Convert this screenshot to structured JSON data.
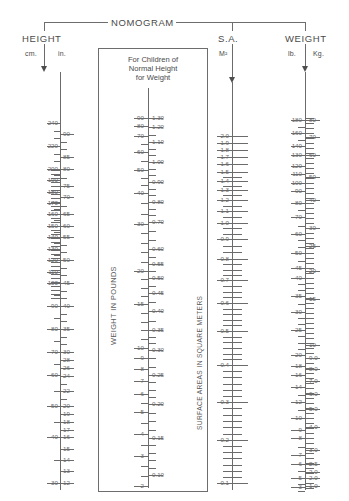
{
  "header": {
    "main_title": "NOMOGRAM",
    "height_title": "HEIGHT",
    "height_unit_left": "cm.",
    "height_unit_right": "in.",
    "sa_title": "S.A.",
    "sa_unit": "M²",
    "weight_title": "WEIGHT",
    "weight_unit_left": "lb.",
    "weight_unit_right": "Kg."
  },
  "panel": {
    "title_line1": "For Children of",
    "title_line2": "Normal Height",
    "title_line3": "for Weight",
    "caption_left": "WEIGHT IN POUNDS",
    "caption_right": "SURFACE AREAS IN SQUARE METERS"
  },
  "chart_data": {
    "type": "nomogram",
    "title": "NOMOGRAM",
    "scales": [
      {
        "name": "height-cm",
        "label": "cm.",
        "side": "left",
        "axis": "height",
        "unit": "cm",
        "ticks": [
          240,
          220,
          200,
          190,
          180,
          170,
          160,
          150,
          140,
          130,
          120,
          110,
          100,
          90,
          80,
          70,
          60,
          50,
          40,
          30
        ],
        "range": [
          30,
          245
        ]
      },
      {
        "name": "height-in",
        "label": "in.",
        "side": "right",
        "axis": "height",
        "unit": "in",
        "ticks": [
          90,
          85,
          80,
          75,
          70,
          65,
          60,
          55,
          50,
          45,
          40,
          35,
          30,
          28,
          26,
          24,
          22,
          20,
          19,
          18,
          17,
          16,
          15,
          14,
          13,
          12
        ],
        "range": [
          12,
          95
        ]
      },
      {
        "name": "panel-weight-pounds",
        "label": "WEIGHT IN POUNDS",
        "side": "left",
        "axis": "panel",
        "unit": "lb",
        "ticks": [
          90,
          80,
          70,
          60,
          50,
          40,
          30,
          20,
          15,
          10,
          9,
          8,
          7,
          6,
          5,
          4,
          3,
          2
        ],
        "range": [
          2,
          95
        ]
      },
      {
        "name": "panel-surface-area",
        "label": "SURFACE AREAS IN SQUARE METERS",
        "side": "right",
        "axis": "panel",
        "unit": "M2",
        "ticks": [
          "1.30",
          "1.20",
          "1.10",
          "1.00",
          "0.90",
          "0.80",
          "0.70",
          "0.60",
          "0.55",
          "0.50",
          "0.45",
          "0.40",
          "0.35",
          "0.30",
          "0.25",
          "0.20",
          "0.15",
          "0.10"
        ],
        "range": [
          0.1,
          1.35
        ]
      },
      {
        "name": "surface-area",
        "label": "S.A.",
        "side": "left",
        "axis": "sa",
        "unit": "M2",
        "ticks": [
          "2.0",
          "1.9",
          "1.8",
          "1.7",
          "1.6",
          "1.5",
          "1.4",
          "1.3",
          "1.2",
          "1.1",
          "1.0",
          "0.9",
          "0.8",
          "0.7",
          "0.6",
          "0.5",
          "0.4",
          "0.3",
          "0.2",
          "0.1"
        ],
        "range": [
          0.1,
          2.05
        ]
      },
      {
        "name": "weight-lb",
        "label": "lb.",
        "side": "left",
        "axis": "weight",
        "unit": "lb",
        "ticks": [
          180,
          160,
          140,
          130,
          120,
          110,
          100,
          90,
          80,
          70,
          60,
          50,
          45,
          40,
          35,
          30,
          25,
          20,
          18,
          16,
          14,
          12,
          10,
          9,
          8,
          7,
          6,
          5,
          4,
          3
        ],
        "range": [
          3,
          185
        ]
      },
      {
        "name": "weight-kg",
        "label": "Kg.",
        "side": "right",
        "axis": "weight",
        "unit": "kg",
        "ticks": [
          80,
          70,
          60,
          50,
          40,
          30,
          25,
          20,
          15,
          10,
          "9.0",
          "8.0",
          "7.0",
          "6.0",
          "5.0",
          "4.0",
          "3.0",
          "2.5",
          "2.0",
          "1.5",
          "1.0"
        ],
        "range": [
          1.0,
          82
        ]
      }
    ]
  }
}
